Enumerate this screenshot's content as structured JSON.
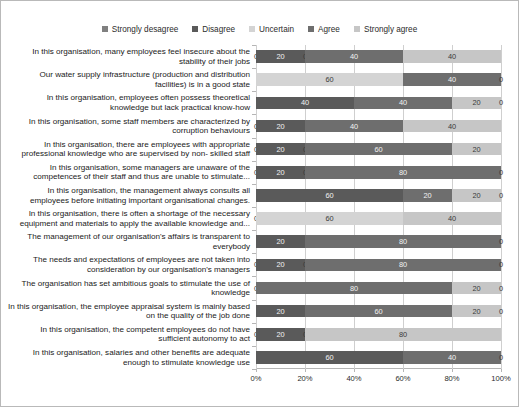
{
  "chart_data": {
    "type": "bar",
    "subtype": "horizontal-stacked-percent",
    "title": "",
    "xlabel": "",
    "ylabel": "",
    "xlim": [
      0,
      100
    ],
    "xticks": [
      "0%",
      "20%",
      "40%",
      "60%",
      "80%",
      "100%"
    ],
    "xtick_values": [
      0,
      20,
      40,
      60,
      80,
      100
    ],
    "grid": true,
    "legend_position": "top-center",
    "series": [
      {
        "name": "Strongly desagree",
        "color": "#808080",
        "values": [
          0,
          0,
          0,
          0,
          0,
          0,
          0,
          0,
          0,
          0,
          0,
          0,
          0,
          0
        ]
      },
      {
        "name": "Disagree",
        "color": "#5a5a5a",
        "values": [
          20,
          0,
          40,
          20,
          20,
          20,
          60,
          0,
          20,
          20,
          0,
          20,
          20,
          60
        ]
      },
      {
        "name": "Uncertain",
        "color": "#d4d4d4",
        "values": [
          0,
          60,
          0,
          0,
          0,
          0,
          0,
          60,
          0,
          0,
          0,
          0,
          0,
          0
        ]
      },
      {
        "name": "Agree",
        "color": "#6e6e6e",
        "values": [
          40,
          40,
          40,
          40,
          60,
          80,
          20,
          0,
          80,
          80,
          80,
          60,
          0,
          40
        ]
      },
      {
        "name": "Strongly agree",
        "color": "#c6c6c6",
        "values": [
          40,
          0,
          20,
          40,
          20,
          0,
          20,
          40,
          0,
          0,
          20,
          20,
          80,
          0
        ]
      }
    ],
    "categories": [
      "In this organisation, many employees feel insecure about the stability of their jobs",
      "Our water supply infrastructure (production and distribution facilities) is in a good state",
      "In this organisation, employees often possess theoretical knowledge but lack practical know-how",
      "In this organisation, some staff members are characterized by corruption behaviours",
      "In this organisation, there are employees with appropriate professional knowledge who are supervised by non- skilled staff",
      "In this organisation, some managers are unaware of the competences of their staff and thus are unable to stimulate...",
      "In this organisation, the management always consults all employees before initiating important organisational changes.",
      "In this organisation, there is often a shortage of the necessary equipment and materials to apply the available knowledge and...",
      "The management of our organisation's affairs is transparent to everybody",
      "The needs and expectations of employees are not taken into consideration by our organisation's managers",
      "The organisation has set ambitious goals to stimulate the use of knowledge",
      "In this organisation, the employee appraisal system  is mainly based on the quality of the job done",
      "In this organisation, the competent employees do not have sufficient autonomy to act",
      "In this organisation, salaries and other benefits are adequate enough to stimulate knowledge use"
    ],
    "rows": [
      {
        "label_index": 0,
        "segments": [
          {
            "series": "Strongly desagree",
            "value": 0,
            "data_label": "0"
          },
          {
            "series": "Disagree",
            "value": 20,
            "data_label": "20"
          },
          {
            "series": "Uncertain",
            "value": 0,
            "data_label": "0"
          },
          {
            "series": "Agree",
            "value": 40,
            "data_label": "40"
          },
          {
            "series": "Strongly agree",
            "value": 40,
            "data_label": "40"
          }
        ]
      },
      {
        "label_index": 1,
        "segments": [
          {
            "series": "Strongly desagree",
            "value": 0,
            "data_label": ""
          },
          {
            "series": "Disagree",
            "value": 0,
            "data_label": ""
          },
          {
            "series": "Uncertain",
            "value": 60,
            "data_label": "60"
          },
          {
            "series": "Agree",
            "value": 40,
            "data_label": "40"
          },
          {
            "series": "Strongly agree",
            "value": 0,
            "data_label": "0"
          }
        ]
      },
      {
        "label_index": 2,
        "segments": [
          {
            "series": "Strongly desagree",
            "value": 0,
            "data_label": ""
          },
          {
            "series": "Disagree",
            "value": 40,
            "data_label": "40"
          },
          {
            "series": "Uncertain",
            "value": 0,
            "data_label": ""
          },
          {
            "series": "Agree",
            "value": 40,
            "data_label": "40"
          },
          {
            "series": "Strongly agree",
            "value": 20,
            "data_label": "20"
          },
          {
            "series": "trailing",
            "value": 0,
            "data_label": "0"
          }
        ]
      },
      {
        "label_index": 3,
        "segments": [
          {
            "series": "Strongly desagree",
            "value": 0,
            "data_label": "0"
          },
          {
            "series": "Disagree",
            "value": 20,
            "data_label": "20"
          },
          {
            "series": "Uncertain",
            "value": 0,
            "data_label": ""
          },
          {
            "series": "Agree",
            "value": 40,
            "data_label": "40"
          },
          {
            "series": "Strongly agree",
            "value": 40,
            "data_label": "40"
          }
        ]
      },
      {
        "label_index": 4,
        "segments": [
          {
            "series": "Strongly desagree",
            "value": 0,
            "data_label": "0"
          },
          {
            "series": "Disagree",
            "value": 20,
            "data_label": "20"
          },
          {
            "series": "Uncertain",
            "value": 0,
            "data_label": "0"
          },
          {
            "series": "Agree",
            "value": 60,
            "data_label": "60"
          },
          {
            "series": "Strongly agree",
            "value": 20,
            "data_label": "20"
          }
        ]
      },
      {
        "label_index": 5,
        "segments": [
          {
            "series": "Strongly desagree",
            "value": 0,
            "data_label": "0"
          },
          {
            "series": "Disagree",
            "value": 20,
            "data_label": "20"
          },
          {
            "series": "Uncertain",
            "value": 0,
            "data_label": "0"
          },
          {
            "series": "Agree",
            "value": 80,
            "data_label": "80"
          },
          {
            "series": "Strongly agree",
            "value": 0,
            "data_label": "0"
          }
        ]
      },
      {
        "label_index": 6,
        "segments": [
          {
            "series": "Strongly desagree",
            "value": 0,
            "data_label": ""
          },
          {
            "series": "Disagree",
            "value": 60,
            "data_label": "60"
          },
          {
            "series": "Uncertain",
            "value": 0,
            "data_label": ""
          },
          {
            "series": "Agree",
            "value": 20,
            "data_label": "20"
          },
          {
            "series": "Strongly agree",
            "value": 20,
            "data_label": "20"
          },
          {
            "series": "trailing",
            "value": 0,
            "data_label": "0"
          }
        ]
      },
      {
        "label_index": 7,
        "segments": [
          {
            "series": "Strongly desagree",
            "value": 0,
            "data_label": "0"
          },
          {
            "series": "Disagree",
            "value": 0,
            "data_label": ""
          },
          {
            "series": "Uncertain",
            "value": 60,
            "data_label": "60"
          },
          {
            "series": "Agree",
            "value": 0,
            "data_label": ""
          },
          {
            "series": "Strongly agree",
            "value": 40,
            "data_label": "40"
          }
        ]
      },
      {
        "label_index": 8,
        "segments": [
          {
            "series": "Strongly desagree",
            "value": 0,
            "data_label": ""
          },
          {
            "series": "Disagree",
            "value": 20,
            "data_label": "20"
          },
          {
            "series": "Uncertain",
            "value": 0,
            "data_label": ""
          },
          {
            "series": "Agree",
            "value": 80,
            "data_label": "80"
          },
          {
            "series": "Strongly agree",
            "value": 0,
            "data_label": "0"
          }
        ]
      },
      {
        "label_index": 9,
        "segments": [
          {
            "series": "Strongly desagree",
            "value": 0,
            "data_label": "0"
          },
          {
            "series": "Disagree",
            "value": 20,
            "data_label": "20"
          },
          {
            "series": "Uncertain",
            "value": 0,
            "data_label": "0"
          },
          {
            "series": "Agree",
            "value": 80,
            "data_label": "80"
          },
          {
            "series": "Strongly agree",
            "value": 0,
            "data_label": "0"
          }
        ]
      },
      {
        "label_index": 10,
        "segments": [
          {
            "series": "Strongly desagree",
            "value": 0,
            "data_label": "0"
          },
          {
            "series": "Disagree",
            "value": 0,
            "data_label": ""
          },
          {
            "series": "Uncertain",
            "value": 0,
            "data_label": ""
          },
          {
            "series": "Agree",
            "value": 80,
            "data_label": "80"
          },
          {
            "series": "Strongly agree",
            "value": 20,
            "data_label": "20"
          },
          {
            "series": "trailing",
            "value": 0,
            "data_label": "0"
          }
        ]
      },
      {
        "label_index": 11,
        "segments": [
          {
            "series": "Strongly desagree",
            "value": 0,
            "data_label": ""
          },
          {
            "series": "Disagree",
            "value": 20,
            "data_label": "20"
          },
          {
            "series": "Uncertain",
            "value": 0,
            "data_label": ""
          },
          {
            "series": "Agree",
            "value": 60,
            "data_label": "60"
          },
          {
            "series": "Strongly agree",
            "value": 20,
            "data_label": "20"
          },
          {
            "series": "trailing",
            "value": 0,
            "data_label": "0"
          }
        ]
      },
      {
        "label_index": 12,
        "segments": [
          {
            "series": "Strongly desagree",
            "value": 0,
            "data_label": "0"
          },
          {
            "series": "Disagree",
            "value": 20,
            "data_label": "20"
          },
          {
            "series": "Uncertain",
            "value": 0,
            "data_label": "0"
          },
          {
            "series": "Agree",
            "value": 0,
            "data_label": ""
          },
          {
            "series": "Strongly agree",
            "value": 80,
            "data_label": "80"
          }
        ]
      },
      {
        "label_index": 13,
        "segments": [
          {
            "series": "Strongly desagree",
            "value": 0,
            "data_label": ""
          },
          {
            "series": "Disagree",
            "value": 60,
            "data_label": "60"
          },
          {
            "series": "Uncertain",
            "value": 0,
            "data_label": ""
          },
          {
            "series": "Agree",
            "value": 40,
            "data_label": "40"
          },
          {
            "series": "Strongly agree",
            "value": 0,
            "data_label": "0"
          }
        ]
      }
    ]
  },
  "legend": {
    "items": [
      {
        "label": "Strongly desagree",
        "color": "#808080"
      },
      {
        "label": "Disagree",
        "color": "#5a5a5a"
      },
      {
        "label": "Uncertain",
        "color": "#d4d4d4"
      },
      {
        "label": "Agree",
        "color": "#6e6e6e"
      },
      {
        "label": "Strongly agree",
        "color": "#c6c6c6"
      }
    ]
  },
  "axis": {
    "tick_labels": [
      "0%",
      "20%",
      "40%",
      "60%",
      "80%",
      "100%"
    ]
  }
}
